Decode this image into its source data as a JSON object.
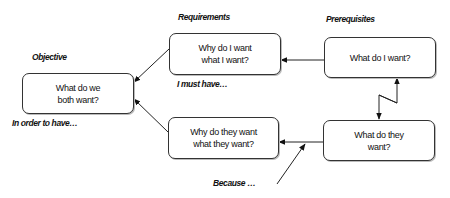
{
  "diagram": {
    "type": "conflict-resolution-cloud",
    "nodes": {
      "objective": {
        "text": "What do we\nboth want?"
      },
      "requirement_self": {
        "text": "Why do I want\nwhat I want?"
      },
      "prerequisite_self": {
        "text": "What do I want?"
      },
      "requirement_other": {
        "text": "Why do they want\nwhat they want?"
      },
      "prerequisite_other": {
        "text": "What do they\nwant?"
      }
    },
    "labels": {
      "objective": "Objective",
      "requirements": "Requirements",
      "prerequisites": "Prerequisites",
      "i_must_have": "I must have…",
      "in_order_to_have": "In order to have…",
      "because": "Because …"
    },
    "edges": [
      {
        "from": "prerequisite_self",
        "to": "requirement_self"
      },
      {
        "from": "requirement_self",
        "to": "objective"
      },
      {
        "from": "prerequisite_other",
        "to": "requirement_other"
      },
      {
        "from": "requirement_other",
        "to": "objective"
      },
      {
        "from": "prerequisite_self",
        "to": "prerequisite_other",
        "style": "conflict-zigzag",
        "bidirectional": true
      },
      {
        "from": "because",
        "to": "prerequisite_other-requirement_other-edge",
        "style": "assumption"
      }
    ],
    "colors": {
      "stroke": "#333333",
      "text": "#111111",
      "background": "#ffffff"
    }
  }
}
